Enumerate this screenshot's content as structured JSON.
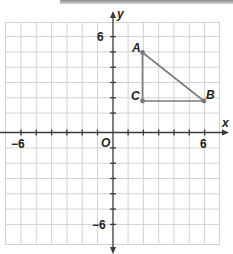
{
  "axes": {
    "x_label": "x",
    "y_label": "y",
    "origin_label": "O",
    "x_tick_labels": {
      "neg": "−6",
      "pos": "6"
    },
    "y_tick_labels": {
      "neg": "−6",
      "pos": "6"
    },
    "range": {
      "xmin": -7,
      "xmax": 7,
      "ymin": -7,
      "ymax": 7
    }
  },
  "points": [
    {
      "label": "A",
      "x": 2,
      "y": 5
    },
    {
      "label": "B",
      "x": 6,
      "y": 2
    },
    {
      "label": "C",
      "x": 2,
      "y": 2
    }
  ],
  "polygon": {
    "name": "triangle ABC",
    "vertices": [
      "A",
      "B",
      "C"
    ],
    "color": "#7a7a7a"
  },
  "colors": {
    "grid": "#cfcfcf",
    "axis": "#333333",
    "shape": "#777777",
    "point": "#777777"
  }
}
